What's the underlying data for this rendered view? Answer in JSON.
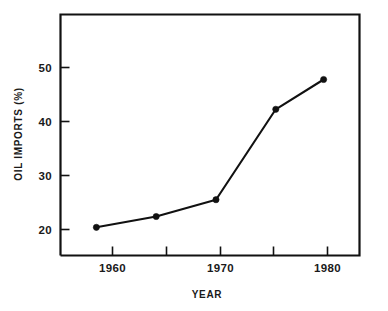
{
  "chart_data": {
    "type": "line",
    "title": "",
    "subtitle": "",
    "xlabel": "YEAR",
    "ylabel": "OIL IMPORTS (%)",
    "xlim": [
      1957.0,
      1982.0
    ],
    "ylim": [
      13.5,
      58.0
    ],
    "grid": false,
    "legend": "none",
    "x_ticks": [
      1960,
      1965,
      1970,
      1975,
      1980
    ],
    "x_tick_labels": [
      "1960",
      "",
      "1970",
      "",
      "1980"
    ],
    "y_ticks": [
      20,
      30,
      40,
      50
    ],
    "y_tick_labels": [
      "20",
      "30",
      "40",
      "50"
    ],
    "series": [
      {
        "name": "Oil imports",
        "marker": "filled-circle",
        "color": "#111111",
        "x": [
          1960,
          1965,
          1970,
          1975,
          1979
        ],
        "values": [
          18.7,
          20.7,
          23.8,
          40.5,
          46.0
        ]
      }
    ],
    "annotations": []
  },
  "axes": {
    "x_tick_label_0": "1960",
    "x_tick_label_1": "1970",
    "x_tick_label_2": "1980",
    "y_tick_label_0": "20",
    "y_tick_label_1": "30",
    "y_tick_label_2": "40",
    "y_tick_label_3": "50",
    "x_axis_title": "YEAR",
    "y_axis_title": "OIL IMPORTS (%)"
  },
  "style": {
    "ink": "#111111",
    "background": "#ffffff"
  }
}
